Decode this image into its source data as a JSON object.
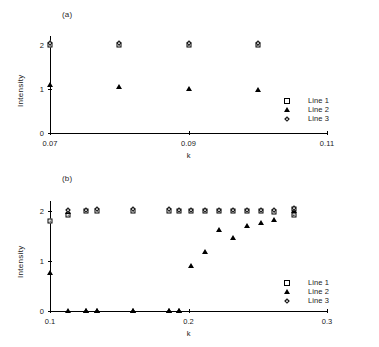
{
  "figure": {
    "panel_a_label": "(a)",
    "panel_b_label": "(b)"
  },
  "legend": {
    "entries": [
      {
        "label": "Line 1",
        "marker": "square-marker"
      },
      {
        "label": "Line 2",
        "marker": "triangle-marker"
      },
      {
        "label": "Line 3",
        "marker": "diamond-marker"
      }
    ]
  },
  "chart_data": [
    {
      "type": "scatter",
      "panel": "(a)",
      "title": "",
      "xlabel": "k",
      "ylabel": "Intensity",
      "xlim": [
        0.07,
        0.11
      ],
      "ylim": [
        0,
        2.2
      ],
      "xticks": [
        0.07,
        0.09,
        0.11
      ],
      "xticklabels": [
        "0.07",
        "0.09",
        "0.11"
      ],
      "yticks": [
        0,
        1,
        2
      ],
      "yticklabels": [
        "0",
        "1",
        "2"
      ],
      "grid": false,
      "legend_position": "right-center",
      "series": [
        {
          "name": "Line 1",
          "marker": "square",
          "x": [
            0.07,
            0.08,
            0.09,
            0.1
          ],
          "y": [
            2.0,
            2.0,
            2.0,
            2.0
          ]
        },
        {
          "name": "Line 2",
          "marker": "triangle",
          "x": [
            0.07,
            0.08,
            0.09,
            0.1
          ],
          "y": [
            1.1,
            1.05,
            1.0,
            0.97
          ]
        },
        {
          "name": "Line 3",
          "marker": "diamond",
          "x": [
            0.07,
            0.08,
            0.09,
            0.1
          ],
          "y": [
            2.04,
            2.04,
            2.04,
            2.04
          ]
        }
      ]
    },
    {
      "type": "scatter",
      "panel": "(b)",
      "title": "",
      "xlabel": "k",
      "ylabel": "Intensity",
      "xlim": [
        0.1,
        0.3
      ],
      "ylim": [
        0,
        2.2
      ],
      "xticks": [
        0.1,
        0.2,
        0.3
      ],
      "xticklabels": [
        "0.1",
        "0.2",
        "0.3"
      ],
      "yticks": [
        0,
        1,
        2
      ],
      "yticklabels": [
        "0",
        "1",
        "2"
      ],
      "grid": false,
      "legend_position": "right-lower",
      "series": [
        {
          "name": "Line 1",
          "marker": "square",
          "x": [
            0.1,
            0.113,
            0.126,
            0.134,
            0.16,
            0.186,
            0.193,
            0.202,
            0.212,
            0.222,
            0.232,
            0.242,
            0.252,
            0.262,
            0.276,
            0.276
          ],
          "y": [
            1.8,
            1.92,
            2.0,
            2.0,
            2.01,
            2.0,
            2.0,
            2.0,
            2.0,
            2.0,
            2.0,
            2.0,
            2.0,
            1.98,
            2.04,
            1.92
          ]
        },
        {
          "name": "Line 2",
          "marker": "triangle",
          "x": [
            0.1,
            0.113,
            0.126,
            0.134,
            0.16,
            0.186,
            0.193,
            0.202,
            0.212,
            0.222,
            0.232,
            0.242,
            0.252,
            0.262,
            0.276
          ],
          "y": [
            0.76,
            1.98,
            0.0,
            0.0,
            0.0,
            0.0,
            0.0,
            0.9,
            1.18,
            1.62,
            1.46,
            1.7,
            1.76,
            1.82,
            2.0
          ]
        },
        {
          "name": "Line 3",
          "marker": "diamond",
          "x": [
            0.113,
            0.126,
            0.134,
            0.16,
            0.186,
            0.193,
            0.202,
            0.212,
            0.222,
            0.232,
            0.242,
            0.252,
            0.262,
            0.276
          ],
          "y": [
            2.02,
            2.02,
            2.04,
            2.04,
            2.04,
            2.02,
            2.02,
            2.02,
            2.02,
            2.02,
            2.02,
            2.02,
            2.02,
            2.06
          ]
        },
        {
          "name": "Line 2 baseline",
          "marker": "triangle",
          "x": [
            0.113,
            0.126,
            0.134,
            0.16,
            0.186,
            0.193
          ],
          "y": [
            0.0,
            0.0,
            0.0,
            0.0,
            0.0,
            0.0
          ]
        }
      ]
    }
  ]
}
